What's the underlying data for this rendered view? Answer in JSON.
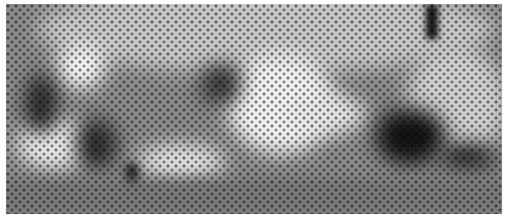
{
  "image": {
    "description": "Halftone dithered grayscale photograph of a person reclining/lying on a surface",
    "style": "glyph halftone",
    "palette": [
      "#ffffff",
      "#d8d8d8",
      "#9a9a9a",
      "#5a5a5a",
      "#1a1a1a"
    ]
  }
}
